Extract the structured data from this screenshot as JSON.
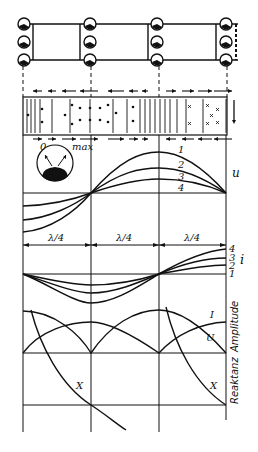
{
  "diagram": {
    "meter": {
      "min_label": "0",
      "max_label": "max"
    },
    "voltage": {
      "axis_label": "u",
      "curve_labels": [
        "1",
        "2",
        "3",
        "4"
      ]
    },
    "segments": [
      "λ/4",
      "λ/4",
      "λ/4"
    ],
    "current": {
      "axis_label": "i",
      "curve_labels": [
        "4",
        "3",
        "2",
        "1"
      ]
    },
    "amplitude": {
      "axis_label": "Amplitude",
      "current_label": "I",
      "voltage_label": "U"
    },
    "reactance": {
      "axis_label": "Reaktanz",
      "curve_label_left": "X",
      "curve_label_right": "X"
    }
  }
}
